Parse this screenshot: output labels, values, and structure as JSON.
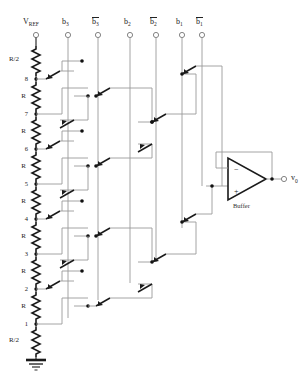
{
  "diagram": {
    "colors": {
      "wire": "#8c8c8c",
      "heavy": "#1a1a1a",
      "node_dot": "#111111",
      "background": "#ffffff"
    }
  },
  "inputs": [
    {
      "id": "vref",
      "label": "V",
      "sub": "REF",
      "overline": false,
      "x": 36
    },
    {
      "id": "b3",
      "label": "b",
      "sub": "3",
      "overline": false,
      "x": 68
    },
    {
      "id": "b3bar",
      "label": "b",
      "sub": "3",
      "overline": true,
      "x": 98
    },
    {
      "id": "b2",
      "label": "b",
      "sub": "2",
      "overline": false,
      "x": 130
    },
    {
      "id": "b2bar",
      "label": "b",
      "sub": "2",
      "overline": true,
      "x": 156
    },
    {
      "id": "b1",
      "label": "b",
      "sub": "1",
      "overline": false,
      "x": 182
    },
    {
      "id": "b1bar",
      "label": "b",
      "sub": "1",
      "overline": true,
      "x": 202
    }
  ],
  "ladder": {
    "resistors": [
      {
        "label": "R/2",
        "index": 0
      },
      {
        "label": "R",
        "index": 1
      },
      {
        "label": "R",
        "index": 2
      },
      {
        "label": "R",
        "index": 3
      },
      {
        "label": "R",
        "index": 4
      },
      {
        "label": "R",
        "index": 5
      },
      {
        "label": "R",
        "index": 6
      },
      {
        "label": "R",
        "index": 7
      },
      {
        "label": "R/2",
        "index": 8
      }
    ],
    "taps": [
      "8",
      "7",
      "6",
      "5",
      "4",
      "3",
      "2",
      "1"
    ],
    "ground": "ground-symbol"
  },
  "buffer": {
    "label": "Buffer",
    "minus": "−",
    "plus": "+"
  },
  "output": {
    "label": "v",
    "sub": "0"
  }
}
